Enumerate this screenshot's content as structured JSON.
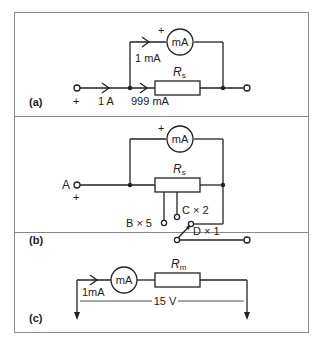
{
  "figure": {
    "panels": [
      {
        "label": "(a)",
        "meter": "mA",
        "meter_plus": "+",
        "branch_current": "1 mA",
        "input_current": "1 A",
        "shunt_current": "999 mA",
        "resistor": "R",
        "resistor_sub": "s",
        "input_plus": "+"
      },
      {
        "label": "(b)",
        "meter": "mA",
        "meter_plus": "+",
        "resistor": "R",
        "resistor_sub": "s",
        "terminal_a": "A",
        "input_plus": "+",
        "tap_b": "B × 5",
        "tap_c": "C × 2",
        "tap_d": "D × 1"
      },
      {
        "label": "(c)",
        "meter": "mA",
        "current": "1mA",
        "resistor": "R",
        "resistor_sub": "m",
        "voltage": "15 V"
      }
    ]
  }
}
